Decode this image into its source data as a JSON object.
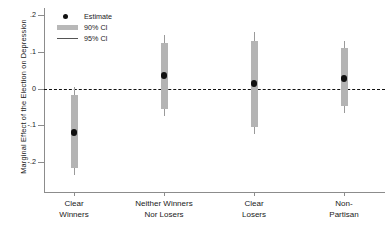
{
  "chart_data": {
    "type": "scatter",
    "title": "",
    "xlabel": "",
    "ylabel": "Marginal Effect of the Election on Depression",
    "ylim": [
      -0.245,
      0.21
    ],
    "yticks": [
      0.2,
      0.1,
      0,
      -0.1,
      -0.2
    ],
    "ytick_labels": [
      ".2",
      ".1",
      "0",
      "-.1",
      "-.2"
    ],
    "grid": false,
    "legend_position": "top-left",
    "reference_line": {
      "y": 0,
      "style": "dashed",
      "color": "#111111"
    },
    "categories": [
      "Clear\nWinners",
      "Neither Winners\nNor Losers",
      "Clear\nLosers",
      "Non-\nPartisan"
    ],
    "points": [
      {
        "category": "Clear Winners",
        "label_line1": "Clear",
        "label_line2": "Winners",
        "estimate": -0.12,
        "ci90_low": -0.215,
        "ci90_high": -0.018,
        "ci95_low": -0.235,
        "ci95_high": 0.005
      },
      {
        "category": "Neither Winners Nor Losers",
        "label_line1": "Neither Winners",
        "label_line2": "Nor Losers",
        "estimate": 0.035,
        "ci90_low": -0.055,
        "ci90_high": 0.125,
        "ci95_low": -0.075,
        "ci95_high": 0.145
      },
      {
        "category": "Clear Losers",
        "label_line1": "Clear",
        "label_line2": "Losers",
        "estimate": 0.013,
        "ci90_low": -0.105,
        "ci90_high": 0.13,
        "ci95_low": -0.125,
        "ci95_high": 0.155
      },
      {
        "category": "Non-Partisan",
        "label_line1": "Non-",
        "label_line2": "Partisan",
        "estimate": 0.028,
        "ci90_low": -0.048,
        "ci90_high": 0.11,
        "ci95_low": -0.068,
        "ci95_high": 0.128
      }
    ],
    "legend": [
      {
        "key": "estimate-dot",
        "label": "Estimate"
      },
      {
        "key": "ci90-bar",
        "label": "90% CI"
      },
      {
        "key": "ci95-line",
        "label": "95% CI"
      }
    ],
    "colors": {
      "estimate": "#111111",
      "ci90": "#b4b4b4",
      "ci95": "#9a9a9a",
      "axis": "#8c8c8c",
      "background": "#ffffff"
    }
  }
}
